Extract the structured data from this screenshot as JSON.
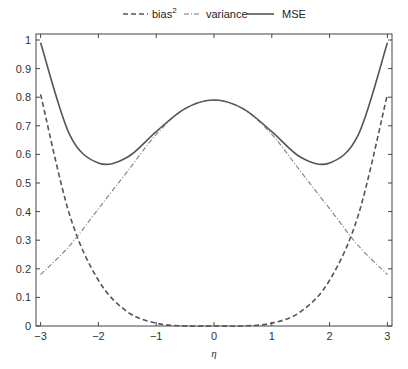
{
  "chart_data": {
    "type": "line",
    "title": "",
    "xlabel": "η",
    "ylabel": "",
    "xlim": [
      -3.1,
      3.1
    ],
    "ylim": [
      0,
      1.03
    ],
    "xticks": [
      -3,
      -2,
      -1,
      0,
      1,
      2,
      3
    ],
    "xtick_labels": [
      "−3",
      "−2",
      "−1",
      "0",
      "1",
      "2",
      "3"
    ],
    "yticks": [
      0,
      0.1,
      0.2,
      0.3,
      0.4,
      0.5,
      0.6,
      0.7,
      0.8,
      0.9,
      1
    ],
    "ytick_labels": [
      "0",
      "0.1",
      "0.2",
      "0.3",
      "0.4",
      "0.5",
      "0.6",
      "0.7",
      "0.8",
      "0.9",
      "1"
    ],
    "grid": false,
    "legend_position": "top-center-outside",
    "x": [
      -3,
      -2.5,
      -2,
      -1.5,
      -1,
      -0.5,
      0,
      0.5,
      1,
      1.5,
      2,
      2.5,
      3
    ],
    "series": [
      {
        "name": "bias²",
        "style": "dashed",
        "values": [
          0.81,
          0.39,
          0.16,
          0.05,
          0.01,
          0.0,
          0.0,
          0.0,
          0.01,
          0.05,
          0.16,
          0.39,
          0.81
        ]
      },
      {
        "name": "variance",
        "style": "dash-dot",
        "values": [
          0.18,
          0.28,
          0.41,
          0.54,
          0.67,
          0.76,
          0.79,
          0.76,
          0.67,
          0.54,
          0.41,
          0.28,
          0.18
        ]
      },
      {
        "name": "MSE",
        "style": "solid",
        "values": [
          0.99,
          0.67,
          0.57,
          0.59,
          0.68,
          0.76,
          0.79,
          0.76,
          0.68,
          0.59,
          0.57,
          0.67,
          0.99
        ]
      }
    ]
  },
  "legend": {
    "items": [
      {
        "label": "bias",
        "sup": "2",
        "style": "dashed"
      },
      {
        "label": "variance",
        "style": "dash-dot"
      },
      {
        "label": "MSE",
        "style": "solid"
      }
    ]
  },
  "colors": {
    "line": "#555555",
    "axis": "#444444"
  }
}
